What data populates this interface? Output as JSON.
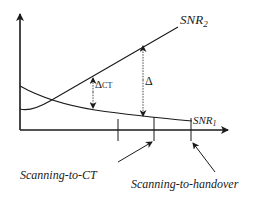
{
  "diagram": {
    "curves": {
      "snr2": {
        "label_main": "SNR",
        "label_sub": "2"
      },
      "snr1": {
        "label_main": "SNR",
        "label_sub": "1"
      }
    },
    "annotations": {
      "delta_ct": {
        "symbol": "Δ",
        "sub": "CT"
      },
      "delta": {
        "symbol": "Δ"
      }
    },
    "thresholds": {
      "scanning_to_ct": "Scanning-to-CT",
      "scanning_to_handover": "Scanning-to-handover"
    },
    "colors": {
      "stroke": "#1a1a1a",
      "background": "#ffffff"
    }
  }
}
